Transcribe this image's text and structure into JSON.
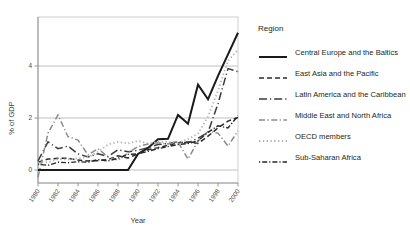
{
  "chart_data": {
    "type": "line",
    "title": "",
    "xlabel": "Year",
    "ylabel": "% of GDP",
    "xlim": [
      1980,
      2000
    ],
    "ylim": [
      -0.45,
      5.5
    ],
    "yticks": [
      0,
      2,
      4
    ],
    "ytick_labels": [
      "0",
      "2",
      "4"
    ],
    "xticks": [
      1980,
      1982,
      1984,
      1986,
      1988,
      1990,
      1992,
      1994,
      1996,
      1998,
      2000
    ],
    "xtick_labels": [
      "1980",
      "1982",
      "1984",
      "1986",
      "1988",
      "1990",
      "1992",
      "1994",
      "1996",
      "1998",
      "2000"
    ],
    "grid": "horizontal",
    "legend_position": "right",
    "legend_title": "Region",
    "x": [
      1980,
      1981,
      1982,
      1983,
      1984,
      1985,
      1986,
      1987,
      1988,
      1989,
      1990,
      1991,
      1992,
      1993,
      1994,
      1995,
      1996,
      1997,
      1998,
      1999,
      2000
    ],
    "series": [
      {
        "name": "Central Europe and the Baltics",
        "color": "#1a1a1a",
        "dash": "solid",
        "width": 2.0,
        "values": [
          0,
          0,
          0,
          0,
          0,
          0,
          0,
          0,
          0,
          0,
          0.62,
          0.85,
          1.18,
          1.2,
          2.12,
          1.78,
          3.28,
          2.72,
          3.62,
          4.45,
          5.28
        ]
      },
      {
        "name": "East Asia and the Pacific",
        "color": "#2b2b2b",
        "dash": "dash",
        "width": 1.5,
        "values": [
          0.3,
          0.42,
          0.45,
          0.45,
          0.38,
          0.35,
          0.36,
          0.4,
          0.55,
          0.46,
          0.62,
          0.78,
          0.86,
          0.95,
          1.05,
          1.08,
          1.02,
          1.3,
          1.62,
          1.88,
          2.02
        ]
      },
      {
        "name": "Latin America and the Caribbean",
        "color": "#3a3a3a",
        "dash": "longdash-dot",
        "width": 1.5,
        "values": [
          0.35,
          1.08,
          0.82,
          0.92,
          0.62,
          0.5,
          0.62,
          0.52,
          0.78,
          0.7,
          0.76,
          0.86,
          0.98,
          1.02,
          1.08,
          1.05,
          1.22,
          1.45,
          2.55,
          3.9,
          3.78
        ]
      },
      {
        "name": "Middle East and North Africa",
        "color": "#8c8c8c",
        "dash": "dashdot",
        "width": 1.5,
        "values": [
          -0.28,
          1.42,
          2.12,
          1.28,
          1.15,
          0.58,
          0.82,
          0.5,
          0.38,
          0.66,
          0.9,
          1.0,
          1.05,
          1.0,
          1.08,
          0.42,
          1.12,
          1.48,
          1.42,
          0.92,
          1.5
        ]
      },
      {
        "name": "OECD members",
        "color": "#b5b5b5",
        "dash": "dot",
        "width": 1.8,
        "values": [
          0.28,
          0.3,
          0.42,
          0.4,
          0.45,
          0.5,
          0.7,
          0.98,
          1.08,
          1.02,
          1.12,
          1.02,
          1.08,
          1.08,
          1.05,
          1.18,
          1.4,
          2.05,
          3.05,
          4.2,
          4.62
        ]
      },
      {
        "name": "Sub-Saharan Africa",
        "color": "#262626",
        "dash": "dot-dash-dot",
        "width": 1.4,
        "values": [
          0.22,
          0.18,
          0.3,
          0.28,
          0.32,
          0.3,
          0.4,
          0.35,
          0.45,
          0.6,
          0.62,
          0.72,
          0.82,
          0.9,
          0.98,
          1.02,
          1.12,
          1.45,
          1.7,
          1.62,
          2.08
        ]
      }
    ]
  },
  "legend": {
    "title": "Region",
    "items": [
      {
        "label": "Central Europe and the Baltics",
        "key": "solid"
      },
      {
        "label": "East Asia and the Pacific",
        "key": "dash"
      },
      {
        "label": "Latin America and the Caribbean",
        "key": "longdash-dot"
      },
      {
        "label": "Middle East and North Africa",
        "key": "dashdot"
      },
      {
        "label": "OECD members",
        "key": "dot"
      },
      {
        "label": "Sub-Saharan Africa",
        "key": "dot-dash-dot"
      }
    ]
  },
  "axes": {
    "ylabel": "% of GDP",
    "xlabel": "Year"
  }
}
